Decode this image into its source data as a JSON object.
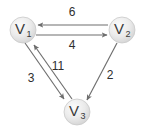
{
  "figure": {
    "background_color": "#ffffff",
    "width": 144,
    "height": 136
  },
  "graph": {
    "type": "directed-weighted-graph",
    "node_fill_color": "#e0e0e0",
    "node_stroke_color": "#c9c9c9",
    "edge_color": "#6e6e6e",
    "label_color": "#2e2e2e",
    "nodes": [
      {
        "id": "V1",
        "label": "V",
        "subscript": "1",
        "cx": 23,
        "cy": 30,
        "r": 13
      },
      {
        "id": "V2",
        "label": "V",
        "subscript": "2",
        "cx": 122,
        "cy": 30,
        "r": 13
      },
      {
        "id": "V3",
        "label": "V",
        "subscript": "3",
        "cx": 77,
        "cy": 112,
        "r": 13
      }
    ],
    "edges": [
      {
        "id": "e-v2-v1",
        "from": "V2",
        "to": "V1",
        "weight": "6",
        "label_x": 72,
        "label_y": 13
      },
      {
        "id": "e-v1-v2",
        "from": "V1",
        "to": "V2",
        "weight": "4",
        "label_x": 72,
        "label_y": 46
      },
      {
        "id": "e-v3-v1",
        "from": "V3",
        "to": "V1",
        "weight": "11",
        "label_x": 58,
        "label_y": 67
      },
      {
        "id": "e-v1-v3",
        "from": "V1",
        "to": "V3",
        "weight": "3",
        "label_x": 31,
        "label_y": 79
      },
      {
        "id": "e-v2-v3",
        "from": "V2",
        "to": "V3",
        "weight": "2",
        "label_x": 110,
        "label_y": 76
      }
    ]
  }
}
